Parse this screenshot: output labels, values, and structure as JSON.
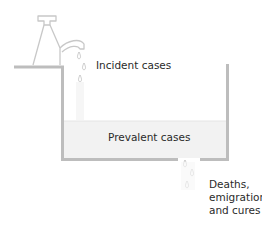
{
  "diagram": {
    "type": "bathtub-model",
    "labels": {
      "incident": "Incident cases",
      "prevalent": "Prevalent cases",
      "outflow": [
        "Deaths,",
        "emigrations",
        "and cures"
      ]
    },
    "icons": {
      "tap": "tap-icon",
      "inflow_drops": "water-drops-icon",
      "outflow_drops": "water-drops-icon"
    },
    "colors": {
      "outline": "#bdbdbd",
      "water": "#f2f2f2",
      "tap_stroke": "#c8c8c8",
      "text": "#2a2a2a"
    }
  }
}
